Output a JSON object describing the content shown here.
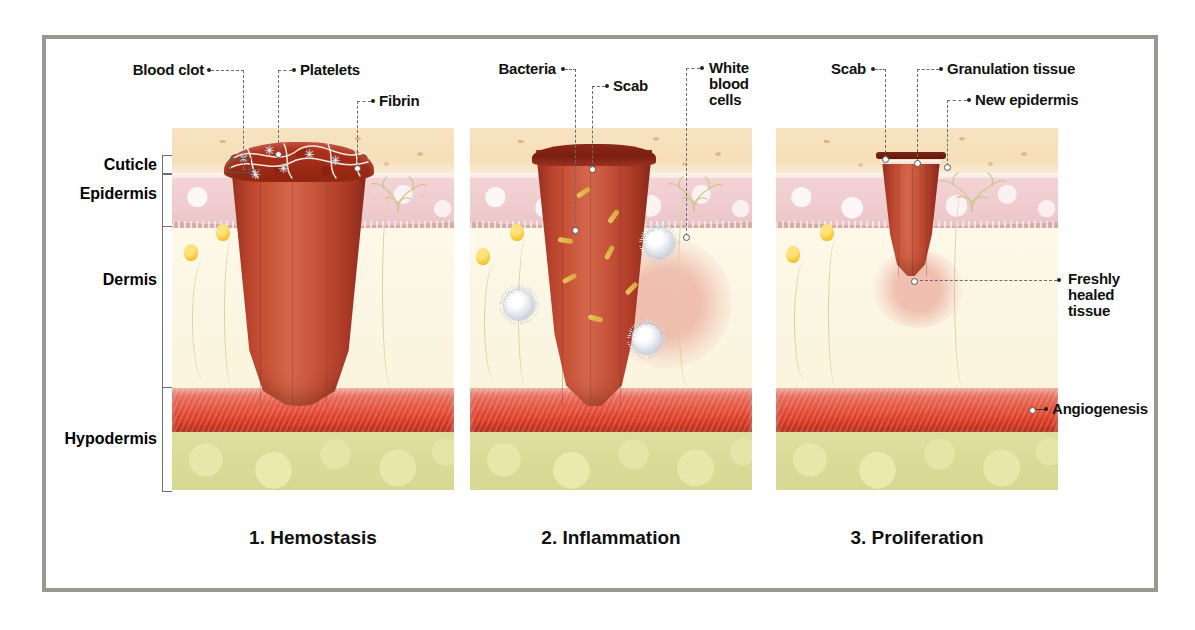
{
  "figure": {
    "frame_color": "#9a978f",
    "background": "#ffffff"
  },
  "depth_axis": {
    "labels": [
      {
        "id": "cuticle",
        "text": "Cuticle"
      },
      {
        "id": "epidermis",
        "text": "Epidermis"
      },
      {
        "id": "dermis",
        "text": "Dermis"
      },
      {
        "id": "hypodermis",
        "text": "Hypodermis"
      }
    ]
  },
  "panels": [
    {
      "id": "hemostasis",
      "caption": "1. Hemostasis",
      "callouts": [
        {
          "id": "blood-clot",
          "text": "Blood clot"
        },
        {
          "id": "platelets",
          "text": "Platelets"
        },
        {
          "id": "fibrin",
          "text": "Fibrin"
        }
      ]
    },
    {
      "id": "inflammation",
      "caption": "2. Inflammation",
      "callouts": [
        {
          "id": "bacteria",
          "text": "Bacteria"
        },
        {
          "id": "scab",
          "text": "Scab"
        },
        {
          "id": "white-blood-cells",
          "text": "White\nblood\ncells"
        }
      ]
    },
    {
      "id": "proliferation",
      "caption": "3. Proliferation",
      "callouts": [
        {
          "id": "scab",
          "text": "Scab"
        },
        {
          "id": "granulation-tissue",
          "text": "Granulation tissue"
        },
        {
          "id": "new-epidermis",
          "text": "New epidermis"
        },
        {
          "id": "freshly-healed-tissue",
          "text": "Freshly\nhealed\ntissue"
        },
        {
          "id": "angiogenesis",
          "text": "Angiogenesis"
        }
      ]
    }
  ],
  "tissue_colors": {
    "cuticle": "#f6dfb8",
    "epidermis": "#eec9cc",
    "dermis": "#fbf6e2",
    "blood_vessel": "#d93b23",
    "hypodermis_fat": "#d8d894",
    "wound": "#c2512f",
    "clot": "#8e240f",
    "bacteria": "#d9a83c",
    "white_blood_cell": "#d5dce4"
  }
}
